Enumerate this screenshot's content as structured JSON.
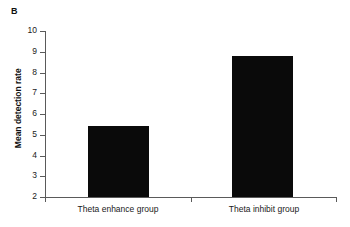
{
  "panel": {
    "letter": "B"
  },
  "chart_data": {
    "type": "bar",
    "title": "",
    "subtitle": "",
    "xlabel": "",
    "ylabel": "Mean detection rate",
    "categories": [
      "Theta enhance group",
      "Theta inhibit group"
    ],
    "values": [
      5.4,
      8.8
    ],
    "ylim": [
      2,
      10
    ],
    "yticks": [
      2,
      3,
      4,
      5,
      6,
      7,
      8,
      9,
      10
    ],
    "ytick_labels": [
      "2",
      "3",
      "4",
      "5",
      "6",
      "7",
      "8",
      "9",
      "10"
    ],
    "grid": false,
    "legend": null,
    "bar_color": "#0a0a0a",
    "axis_color": "#5a5a5a",
    "background": "#ffffff",
    "series": [
      {
        "name": "Mean detection rate",
        "values": [
          5.4,
          8.8
        ]
      }
    ]
  }
}
